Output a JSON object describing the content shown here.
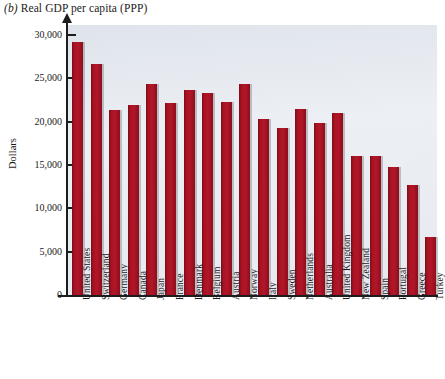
{
  "chart_data": {
    "type": "bar",
    "title": "(b) Real GDP per capita (PPP)",
    "title_paren": "(b)",
    "title_rest": " Real GDP per capita (PPP)",
    "xlabel": "",
    "ylabel": "Dollars",
    "ylim": [
      0,
      30000
    ],
    "ytick_values": [
      0,
      5000,
      10000,
      15000,
      20000,
      25000,
      30000
    ],
    "ytick_labels": [
      "0",
      "5,000",
      "10,000",
      "15,000",
      "20,000",
      "25,000",
      "30,000"
    ],
    "grid": false,
    "legend": false,
    "bar_color": "#9d101f",
    "plot_background": "#e7ebf0",
    "categories": [
      "United States",
      "Switzerland",
      "Germany",
      "Canada",
      "Japan",
      "France",
      "Denmark",
      "Belgium",
      "Austria",
      "Norway",
      "Italy",
      "Sweden",
      "Netherlands",
      "Australia",
      "United Kingdom",
      "New Zealand",
      "Spain",
      "Portugal",
      "Greece",
      "Turkey"
    ],
    "values": [
      29200,
      26700,
      21300,
      21900,
      24400,
      22200,
      23700,
      23300,
      22300,
      24400,
      20300,
      19300,
      21500,
      19900,
      21000,
      16000,
      16000,
      14800,
      12700,
      6700
    ]
  }
}
